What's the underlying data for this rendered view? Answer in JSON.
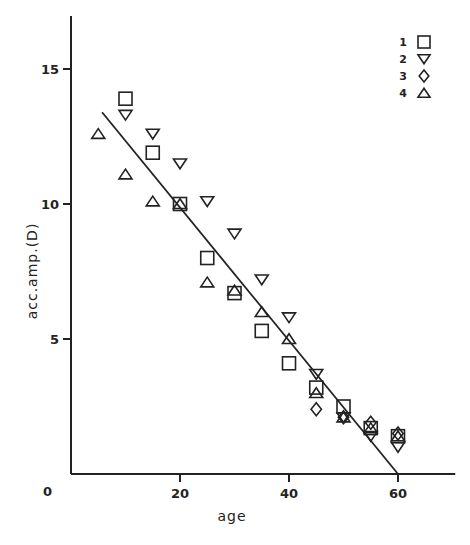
{
  "chart_data": {
    "type": "scatter",
    "title": "",
    "xlabel": "age",
    "ylabel": "acc. amp. (D)",
    "xlim": [
      0,
      70.5
    ],
    "ylim": [
      0,
      17
    ],
    "x_ticks": [
      0,
      20,
      40,
      60
    ],
    "y_ticks": [
      0,
      5,
      10,
      15
    ],
    "x_tick_labels": [
      "0",
      "20",
      "40",
      "60"
    ],
    "y_tick_labels": [
      "0",
      "5",
      "10",
      "15"
    ],
    "grid": false,
    "legend_position": "top-right",
    "series": [
      {
        "name": "1",
        "marker": "square",
        "x": [
          10,
          15,
          20,
          25,
          30,
          35,
          40,
          45,
          50,
          55,
          60
        ],
        "y": [
          13.9,
          11.9,
          10.0,
          8.0,
          6.7,
          5.3,
          4.1,
          3.2,
          2.5,
          1.7,
          1.4
        ]
      },
      {
        "name": "2",
        "marker": "triangle-down",
        "x": [
          10,
          15,
          20,
          25,
          30,
          35,
          40,
          45,
          50,
          55,
          60
        ],
        "y": [
          13.3,
          12.6,
          11.5,
          10.1,
          8.9,
          7.2,
          5.8,
          3.7,
          2.1,
          1.4,
          1.0
        ]
      },
      {
        "name": "3",
        "marker": "diamond",
        "x": [
          45,
          50,
          55,
          60
        ],
        "y": [
          2.4,
          2.1,
          1.9,
          1.5
        ]
      },
      {
        "name": "4",
        "marker": "triangle-up",
        "x": [
          5,
          10,
          15,
          20,
          25,
          30,
          35,
          40,
          45,
          50,
          55,
          60
        ],
        "y": [
          12.6,
          11.1,
          10.1,
          10.0,
          7.1,
          6.8,
          6.0,
          5.0,
          3.0,
          2.1,
          1.7,
          1.4
        ]
      }
    ],
    "fit_line": {
      "x": [
        5.7,
        60
      ],
      "y": [
        13.4,
        0
      ]
    }
  },
  "legend": [
    {
      "label": "1",
      "marker": "square"
    },
    {
      "label": "2",
      "marker": "triangle-down"
    },
    {
      "label": "3",
      "marker": "diamond"
    },
    {
      "label": "4",
      "marker": "triangle-up"
    }
  ]
}
